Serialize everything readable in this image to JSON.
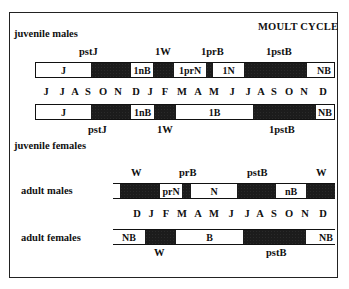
{
  "title": "MOULT CYCLE",
  "sections": {
    "juvenile_males": "juvenile  males",
    "juvenile_females": "juvenile  females",
    "adult_males": "adult  males",
    "adult_females": "adult  females"
  },
  "juvenile_male_bar": {
    "labels_above": [
      "pstJ",
      "1W",
      "1prB",
      "1pstB"
    ],
    "segments": [
      {
        "label": "J",
        "fill": "white"
      },
      {
        "label": "",
        "fill": "black"
      },
      {
        "label": "1nB",
        "fill": "white"
      },
      {
        "label": "",
        "fill": "black"
      },
      {
        "label": "1prN",
        "fill": "white"
      },
      {
        "label": "",
        "fill": "black"
      },
      {
        "label": "1N",
        "fill": "white"
      },
      {
        "label": "",
        "fill": "black"
      },
      {
        "label": "NB",
        "fill": "white"
      }
    ]
  },
  "juvenile_months": [
    "J",
    "J",
    "A",
    "S",
    "O",
    "N",
    "D",
    "J",
    "F",
    "M",
    "A",
    "M",
    "J",
    "J",
    "A",
    "S",
    "O",
    "N",
    "D"
  ],
  "juvenile_female_bar": {
    "labels_below": [
      "pstJ",
      "1W",
      "1pstB"
    ],
    "segments": [
      {
        "label": "J",
        "fill": "white"
      },
      {
        "label": "",
        "fill": "black"
      },
      {
        "label": "1nB",
        "fill": "white"
      },
      {
        "label": "",
        "fill": "black"
      },
      {
        "label": "1B",
        "fill": "white"
      },
      {
        "label": "",
        "fill": "black"
      },
      {
        "label": "NB",
        "fill": "white"
      }
    ]
  },
  "adult_male_bar": {
    "labels_above": [
      "W",
      "prB",
      "pstB",
      "W"
    ],
    "segments": [
      {
        "label": "",
        "fill": "white"
      },
      {
        "label": "",
        "fill": "black"
      },
      {
        "label": "prN",
        "fill": "white"
      },
      {
        "label": "",
        "fill": "black"
      },
      {
        "label": "N",
        "fill": "white"
      },
      {
        "label": "",
        "fill": "black"
      },
      {
        "label": "nB",
        "fill": "white"
      },
      {
        "label": "",
        "fill": "black"
      }
    ]
  },
  "adult_months": [
    "D",
    "J",
    "F",
    "M",
    "A",
    "M",
    "J",
    "J",
    "A",
    "S",
    "O",
    "N",
    "D"
  ],
  "adult_female_bar": {
    "labels_below": [
      "W",
      "pstB"
    ],
    "segments": [
      {
        "label": "NB",
        "fill": "white"
      },
      {
        "label": "",
        "fill": "black"
      },
      {
        "label": "B",
        "fill": "white"
      },
      {
        "label": "",
        "fill": "black"
      },
      {
        "label": "NB",
        "fill": "white"
      }
    ]
  }
}
